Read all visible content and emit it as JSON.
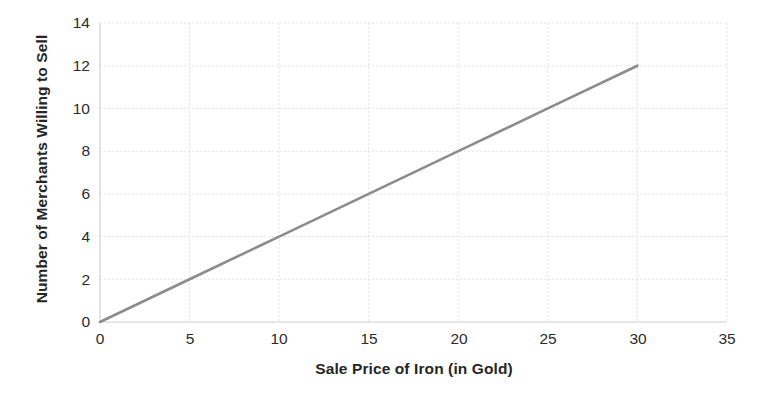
{
  "chart_data": {
    "type": "line",
    "title": "",
    "xlabel": "Sale Price of Iron (in Gold)",
    "ylabel": "Number of Merchants Willing to Sell",
    "xlim": [
      0,
      35
    ],
    "ylim": [
      0,
      14
    ],
    "xticks": [
      0,
      5,
      10,
      15,
      20,
      25,
      30,
      35
    ],
    "yticks": [
      0,
      2,
      4,
      6,
      8,
      10,
      12,
      14
    ],
    "xtick_labels": [
      "0",
      "5",
      "10",
      "15",
      "20",
      "25",
      "30",
      "35"
    ],
    "ytick_labels": [
      "0",
      "2",
      "4",
      "6",
      "8",
      "10",
      "12",
      "14"
    ],
    "grid": true,
    "legend": null,
    "legend_position": "none",
    "series": [
      {
        "name": "Supply",
        "color": "#8c8c8c",
        "x": [
          0,
          5,
          10,
          15,
          20,
          25,
          30
        ],
        "values": [
          0,
          2,
          4,
          6,
          8,
          10,
          12
        ]
      }
    ],
    "annotations": []
  },
  "colors": {
    "line": "#8c8c8c",
    "grid": "#e2e2e2",
    "axis": "#d6d6d6",
    "text": "#262626",
    "background": "#ffffff"
  }
}
